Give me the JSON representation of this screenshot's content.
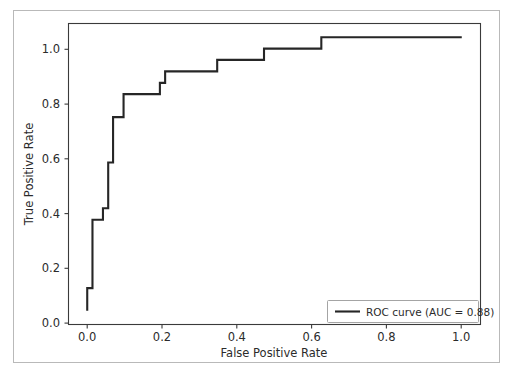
{
  "figure": {
    "background_color": "#ffffff",
    "border_color": "#b9b9b9",
    "line_color": "#262626"
  },
  "chart_data": {
    "type": "line",
    "title": "",
    "subtitle": "",
    "xlabel": "False Positive Rate",
    "ylabel": "True Positive Rate",
    "xlim": [
      -0.05,
      1.05
    ],
    "ylim": [
      -0.05,
      1.05
    ],
    "xticks": [
      0.0,
      0.2,
      0.4,
      0.6,
      0.8,
      1.0
    ],
    "yticks": [
      0.0,
      0.2,
      0.4,
      0.6,
      0.8,
      1.0
    ],
    "xtick_labels": [
      "0.0",
      "0.2",
      "0.4",
      "0.6",
      "0.8",
      "1.0"
    ],
    "ytick_labels": [
      "0.0",
      "0.2",
      "0.4",
      "0.6",
      "0.8",
      "1.0"
    ],
    "grid": false,
    "drawstyle": "steps-post",
    "legend_position": "lower right",
    "series": [
      {
        "name": "ROC curve (AUC = 0.88)",
        "color": "#262626",
        "auc": 0.88,
        "x": [
          0.0,
          0.0,
          0.014,
          0.014,
          0.042,
          0.042,
          0.056,
          0.056,
          0.069,
          0.069,
          0.097,
          0.097,
          0.111,
          0.111,
          0.194,
          0.194,
          0.208,
          0.208,
          0.347,
          0.347,
          0.472,
          0.472,
          0.625,
          0.625,
          1.0
        ],
        "y": [
          0.0,
          0.083,
          0.083,
          0.333,
          0.333,
          0.375,
          0.375,
          0.542,
          0.542,
          0.708,
          0.708,
          0.792,
          0.792,
          0.792,
          0.792,
          0.833,
          0.833,
          0.875,
          0.875,
          0.917,
          0.917,
          0.958,
          0.958,
          1.0,
          1.0
        ]
      }
    ]
  },
  "legend": {
    "entries": [
      {
        "label": "ROC curve (AUC = 0.88)",
        "color": "#262626"
      }
    ]
  },
  "caption": {
    "text": ""
  }
}
